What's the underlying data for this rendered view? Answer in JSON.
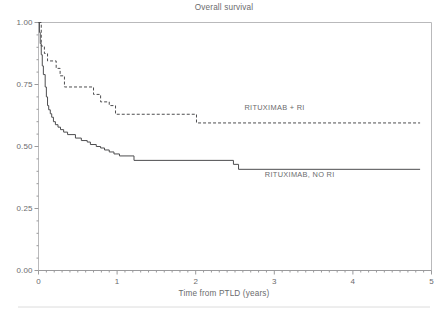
{
  "chart_data": {
    "type": "line",
    "title": "Overall survival",
    "xlabel": "Time from PTLD (years)",
    "ylabel": "",
    "xlim": [
      0,
      5
    ],
    "ylim": [
      0,
      1
    ],
    "grid": false,
    "legend_position": "inline-annotation",
    "x_ticks": [
      "0",
      "1",
      "2",
      "3",
      "4",
      "5"
    ],
    "x_tick_values": [
      0,
      1,
      2,
      3,
      4,
      5
    ],
    "y_ticks": [
      "0.00",
      "0.25",
      "0.50",
      "0.75",
      "1.00"
    ],
    "y_tick_values": [
      0.0,
      0.25,
      0.5,
      0.75,
      1.0
    ],
    "x_minor_tick_interval": 0.1,
    "y_minor_tick_interval": 0.05,
    "series": [
      {
        "name": "RITUXIMAB + RI",
        "style": "dashed",
        "color": "#4d4d4f",
        "label_x": 2.62,
        "label_y": 0.655,
        "points": [
          [
            0.0,
            1.0
          ],
          [
            0.035,
            1.0
          ],
          [
            0.035,
            0.905
          ],
          [
            0.075,
            0.905
          ],
          [
            0.075,
            0.875
          ],
          [
            0.115,
            0.875
          ],
          [
            0.115,
            0.845
          ],
          [
            0.225,
            0.845
          ],
          [
            0.225,
            0.815
          ],
          [
            0.275,
            0.815
          ],
          [
            0.275,
            0.785
          ],
          [
            0.33,
            0.785
          ],
          [
            0.33,
            0.74
          ],
          [
            0.7,
            0.74
          ],
          [
            0.7,
            0.71
          ],
          [
            0.79,
            0.71
          ],
          [
            0.79,
            0.68
          ],
          [
            0.9,
            0.68
          ],
          [
            0.9,
            0.665
          ],
          [
            0.98,
            0.665
          ],
          [
            0.98,
            0.63
          ],
          [
            2.01,
            0.63
          ],
          [
            2.01,
            0.595
          ],
          [
            4.855,
            0.595
          ]
        ]
      },
      {
        "name": "RITUXIMAB, NO RI",
        "style": "solid",
        "color": "#4d4d4f",
        "label_x": 2.88,
        "label_y": 0.385,
        "points": [
          [
            0.0,
            1.0
          ],
          [
            0.012,
            1.0
          ],
          [
            0.012,
            0.96
          ],
          [
            0.022,
            0.96
          ],
          [
            0.022,
            0.915
          ],
          [
            0.035,
            0.915
          ],
          [
            0.035,
            0.87
          ],
          [
            0.048,
            0.87
          ],
          [
            0.048,
            0.825
          ],
          [
            0.062,
            0.825
          ],
          [
            0.062,
            0.79
          ],
          [
            0.085,
            0.79
          ],
          [
            0.085,
            0.74
          ],
          [
            0.1,
            0.74
          ],
          [
            0.1,
            0.7
          ],
          [
            0.115,
            0.7
          ],
          [
            0.115,
            0.665
          ],
          [
            0.13,
            0.665
          ],
          [
            0.13,
            0.648
          ],
          [
            0.15,
            0.648
          ],
          [
            0.15,
            0.632
          ],
          [
            0.168,
            0.632
          ],
          [
            0.168,
            0.618
          ],
          [
            0.19,
            0.618
          ],
          [
            0.19,
            0.6
          ],
          [
            0.215,
            0.6
          ],
          [
            0.215,
            0.588
          ],
          [
            0.248,
            0.588
          ],
          [
            0.248,
            0.578
          ],
          [
            0.28,
            0.578
          ],
          [
            0.28,
            0.568
          ],
          [
            0.32,
            0.568
          ],
          [
            0.32,
            0.558
          ],
          [
            0.37,
            0.558
          ],
          [
            0.37,
            0.548
          ],
          [
            0.47,
            0.548
          ],
          [
            0.47,
            0.534
          ],
          [
            0.545,
            0.534
          ],
          [
            0.545,
            0.524
          ],
          [
            0.62,
            0.524
          ],
          [
            0.62,
            0.518
          ],
          [
            0.66,
            0.518
          ],
          [
            0.66,
            0.508
          ],
          [
            0.735,
            0.508
          ],
          [
            0.735,
            0.5
          ],
          [
            0.79,
            0.5
          ],
          [
            0.79,
            0.494
          ],
          [
            0.84,
            0.494
          ],
          [
            0.84,
            0.486
          ],
          [
            0.9,
            0.486
          ],
          [
            0.9,
            0.478
          ],
          [
            0.96,
            0.478
          ],
          [
            0.96,
            0.47
          ],
          [
            1.03,
            0.47
          ],
          [
            1.03,
            0.462
          ],
          [
            1.215,
            0.462
          ],
          [
            1.215,
            0.444
          ],
          [
            2.48,
            0.444
          ],
          [
            2.48,
            0.428
          ],
          [
            2.545,
            0.428
          ],
          [
            2.545,
            0.408
          ],
          [
            4.855,
            0.408
          ]
        ]
      }
    ]
  },
  "figure": {
    "frame_color": "#b9b9bb",
    "axis_color": "#9a9a9c",
    "text_color": "#6b6b6d",
    "bottom_rule_color": "#dcdcdc"
  }
}
